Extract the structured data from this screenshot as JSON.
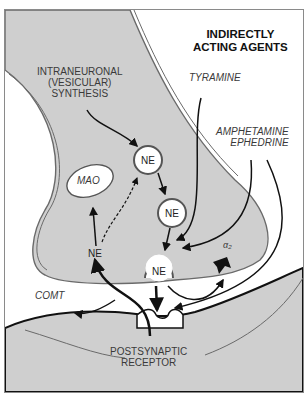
{
  "title": {
    "line1": "INDIRECTLY",
    "line2": "ACTING AGENTS"
  },
  "labels": {
    "synthesis": {
      "line1": "INTRANEURONAL",
      "line2": "(VESICULAR)",
      "line3": "SYNTHESIS"
    },
    "tyramine": "TYRAMINE",
    "amphetamine": "AMPHETAMINE",
    "ephedrine": "EPHEDRINE",
    "mao": "MAO",
    "comt": "COMT",
    "alpha2": "α₂",
    "receptor": {
      "line1": "POSTSYNAPTIC",
      "line2": "RECEPTOR"
    }
  },
  "vesicles": {
    "top": "NE",
    "middle": "NE",
    "docked": "NE",
    "free": "NE"
  },
  "colors": {
    "neuron_fill": "#cfcfcf",
    "background": "#ffffff",
    "outline": "#6a6a6a",
    "arrow": "#111111"
  }
}
